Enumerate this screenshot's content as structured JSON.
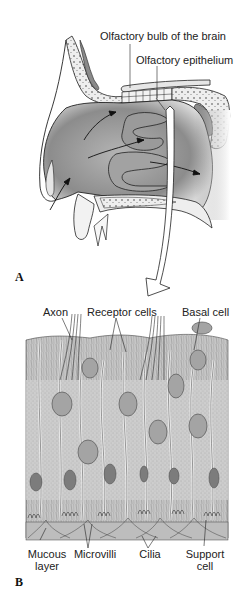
{
  "panels": [
    {
      "id": "A",
      "label": "A",
      "title_implied": "Nasal cavity",
      "annotations": [
        {
          "text": "Olfactory bulb of the brain"
        },
        {
          "text": "Olfactory epithelium"
        }
      ]
    },
    {
      "id": "B",
      "label": "B",
      "title_implied": "Olfactory epithelium detail",
      "annotations_top": [
        {
          "text": "Axon"
        },
        {
          "text": "Receptor cells"
        },
        {
          "text": "Basal cell"
        }
      ],
      "annotations_bottom": [
        {
          "line1": "Mucous",
          "line2": "layer"
        },
        {
          "line1": "Microvilli",
          "line2": ""
        },
        {
          "line1": "Cilia",
          "line2": ""
        },
        {
          "line1": "Support",
          "line2": "cell"
        }
      ]
    }
  ],
  "colors": {
    "background": "#ffffff",
    "cavity_dark": "#7a7a7a",
    "cavity_mid": "#a8a8a8",
    "bone": "#e8e8e8",
    "tissue": "#c8c8c8",
    "line": "#222222",
    "nucleus": "#8a8a8a"
  }
}
